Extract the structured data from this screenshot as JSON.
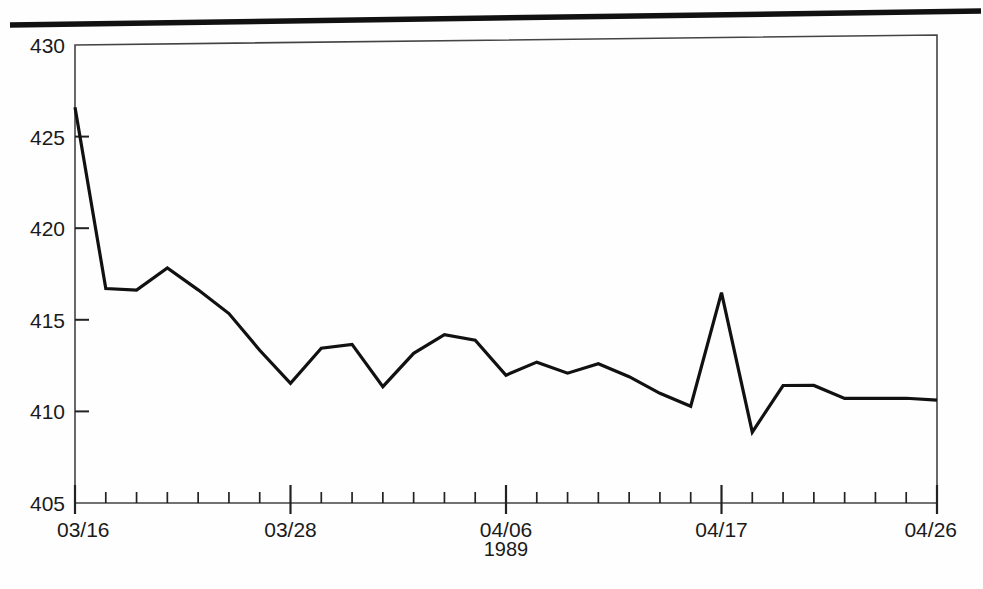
{
  "figure": {
    "background_color": "#fefefe",
    "ink_color": "#1a1a1a",
    "divider_name": "page-divider-rule"
  },
  "chart_data": {
    "type": "line",
    "title": "",
    "subtitle": "",
    "xlabel": "1989",
    "ylabel": "",
    "ylim": [
      405,
      430
    ],
    "y_ticks": [
      405,
      410,
      415,
      420,
      425,
      430
    ],
    "y_tick_labels": [
      "405",
      "410",
      "415",
      "420",
      "425",
      "430"
    ],
    "y_minor_ticks": false,
    "grid": false,
    "legend": null,
    "legend_position": "none",
    "x_tick_labels": [
      "03/16",
      "03/28",
      "04/06",
      "04/17",
      "04/26"
    ],
    "x_labeled_indices": [
      0,
      7,
      14,
      21,
      28
    ],
    "x_total_ticks": 29,
    "x": [
      "03/16",
      "03/17",
      "03/20",
      "03/21",
      "03/22",
      "03/23",
      "03/24",
      "03/28",
      "03/29",
      "03/30",
      "03/31",
      "04/03",
      "04/04",
      "04/05",
      "04/06",
      "04/07",
      "04/10",
      "04/11",
      "04/12",
      "04/13",
      "04/14",
      "04/17",
      "04/18",
      "04/19",
      "04/20",
      "04/21",
      "04/24",
      "04/25",
      "04/26"
    ],
    "series": [
      {
        "name": "index",
        "values": [
          426.6,
          416.7,
          416.6,
          417.8,
          416.6,
          415.3,
          413.3,
          411.5,
          413.4,
          413.6,
          411.3,
          413.1,
          414.1,
          413.8,
          411.9,
          412.6,
          412.0,
          412.5,
          411.8,
          410.9,
          410.2,
          416.3,
          408.8,
          411.3,
          411.3,
          410.6,
          410.6,
          410.6,
          410.5
        ]
      }
    ],
    "line_color": "#111111",
    "line_width": 3.2,
    "markers": "none"
  }
}
